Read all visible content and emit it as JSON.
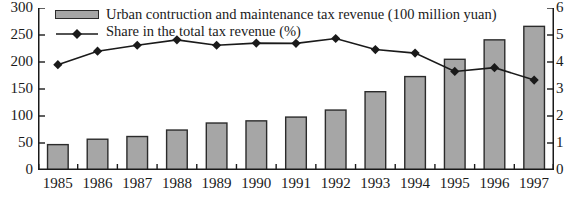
{
  "chart_data": {
    "type": "bar",
    "title": "",
    "xlabel": "",
    "ylabel": "",
    "grid": false,
    "legend_position": "top-left",
    "categories": [
      "1985",
      "1986",
      "1987",
      "1988",
      "1989",
      "1990",
      "1991",
      "1992",
      "1993",
      "1994",
      "1995",
      "1996",
      "1997"
    ],
    "series": [
      {
        "name": "Urban contruction and maintenance tax revenue (100 million yuan)",
        "type": "bar",
        "axis": "left",
        "unit": "100 million yuan",
        "color": "#a6a6a6",
        "edge_color": "#2b2b2b",
        "values": [
          47,
          57,
          62,
          74,
          87,
          91,
          98,
          111,
          145,
          173,
          205,
          241,
          266
        ]
      },
      {
        "name": "Share in the total tax revenue (%)",
        "type": "line",
        "axis": "right",
        "unit": "%",
        "color": "#1a1a1a",
        "marker": "diamond",
        "values": [
          3.9,
          4.4,
          4.62,
          4.82,
          4.62,
          4.7,
          4.69,
          4.87,
          4.46,
          4.33,
          3.65,
          3.79,
          3.33
        ]
      }
    ],
    "axes": {
      "left": {
        "label": "",
        "ylim": [
          0,
          300
        ],
        "ticks": [
          300,
          250,
          200,
          150,
          100,
          50,
          0
        ],
        "tick_labels": [
          "300",
          "250",
          "200",
          "150",
          "100",
          "50",
          "0"
        ]
      },
      "right": {
        "label": "",
        "ylim": [
          0,
          6
        ],
        "ticks": [
          6,
          5,
          4,
          3,
          2,
          1,
          0
        ],
        "tick_labels": [
          "6",
          "5",
          "4",
          "3",
          "2",
          "1",
          "0"
        ]
      },
      "x": {
        "label": "",
        "tick_labels": [
          "1985",
          "1986",
          "1987",
          "1988",
          "1989",
          "1990",
          "1991",
          "1992",
          "1993",
          "1994",
          "1995",
          "1996",
          "1997"
        ]
      }
    }
  },
  "legend": {
    "items": [
      {
        "label": "Urban contruction and maintenance tax revenue (100 million yuan)",
        "marker": "filled-rect-swatch"
      },
      {
        "label": "Share in the total tax revenue (%)",
        "marker": "line-with-diamond-marker"
      }
    ]
  },
  "colors": {
    "bar_fill": "#a6a6a6",
    "bar_edge": "#2b2b2b",
    "line": "#1a1a1a",
    "axis": "#1a1a1a",
    "background": "#ffffff"
  }
}
